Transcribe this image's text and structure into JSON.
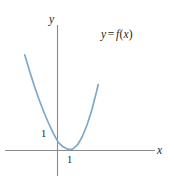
{
  "figure": {
    "title": "",
    "background_color": "#ffffff",
    "width": 174,
    "height": 180
  },
  "axes": {
    "y_axis_name": "y",
    "x_axis_name": "x",
    "axis_color": "#8a8a8a",
    "y_tick_label": "1",
    "x_tick_label": "1"
  },
  "curve": {
    "label_y": "y",
    "label_equals": "=",
    "label_f": "f",
    "label_open_paren": "(",
    "label_arg": "x",
    "label_close_paren": ")",
    "label_full": "y = f(x)",
    "color": "#7ea8c9"
  },
  "chart_data": {
    "type": "line",
    "title": "",
    "xlabel": "x",
    "ylabel": "y",
    "grid": false,
    "legend": "none",
    "annotations": [
      "y = f(x)"
    ],
    "xticks": [
      1
    ],
    "xticklabels": [
      "1"
    ],
    "yticks": [
      1
    ],
    "yticklabels": [
      "1"
    ],
    "xlim": [
      -3.2,
      6.2
    ],
    "ylim": [
      -0.6,
      8.0
    ],
    "series": [
      {
        "name": "y = f(x)",
        "color": "#7ea8c9",
        "comment": "upward-opening parabola, vertex slightly right of and above the origin",
        "x": [
          -2.05,
          -1.75,
          -1.45,
          -1.15,
          -0.85,
          -0.55,
          -0.25,
          0.05,
          0.35,
          0.65,
          0.95,
          1.25,
          1.55,
          1.85,
          2.15,
          2.45,
          2.55
        ],
        "y": [
          6.55,
          5.45,
          4.42,
          3.48,
          2.62,
          1.85,
          1.16,
          0.56,
          0.25,
          0.08,
          0.1,
          0.38,
          0.94,
          1.75,
          2.78,
          4.05,
          4.52
        ]
      }
    ]
  }
}
